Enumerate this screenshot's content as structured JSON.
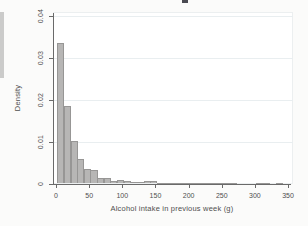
{
  "colors": {
    "page_background": "#fbfbfa",
    "plot_background": "#ffffff",
    "grid_line": "#e9eef0",
    "axis_line": "#6a6a6a",
    "tick_label": "#4f4f4f",
    "bar_fill": "#b7b6b5",
    "bar_border": "#979695",
    "artifact_gray": "#cbcbca",
    "artifact_dark": "#4a4a52"
  },
  "chart_data": {
    "type": "bar",
    "chart_kind": "histogram",
    "title": "",
    "xlabel": "Alcohol intake in previous week (g)",
    "ylabel": "Density",
    "xlim": [
      0,
      357
    ],
    "ylim": [
      0,
      0.04
    ],
    "x_ticks": [
      0,
      50,
      100,
      150,
      200,
      250,
      300,
      350
    ],
    "x_tick_labels": [
      "0",
      "50",
      "100",
      "150",
      "200",
      "250",
      "300",
      "350"
    ],
    "y_ticks": [
      0,
      0.01,
      0.02,
      0.03,
      0.04
    ],
    "y_tick_labels": [
      "0",
      "0.01",
      "0.02",
      "0.03",
      "0.04"
    ],
    "grid": "horizontal gridlines at y ticks",
    "legend": "none",
    "bin_width": 10,
    "bin_start": [
      2,
      12,
      22,
      32,
      42,
      52,
      62,
      72,
      82,
      92,
      102,
      112,
      122,
      132,
      142,
      152,
      162,
      172,
      182,
      192,
      202,
      212,
      222,
      232,
      242,
      252,
      262,
      272,
      282,
      292,
      302,
      312,
      322,
      332
    ],
    "density": [
      0.0335,
      0.0185,
      0.0102,
      0.0059,
      0.0034,
      0.0031,
      0.0013,
      0.0012,
      0.0006,
      0.0008,
      0.0005,
      0.0004,
      0.0004,
      0.0005,
      0.0007,
      0.0002,
      0.0002,
      0.0001,
      0.0001,
      0.0002,
      0.0001,
      0.0001,
      0.0002,
      0.0002,
      0.0001,
      0.0001,
      0.0001,
      0,
      0,
      0,
      0.0001,
      0.0001,
      0,
      0.0001
    ]
  }
}
